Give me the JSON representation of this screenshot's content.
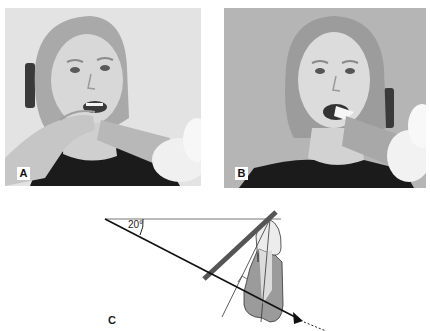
{
  "figure": {
    "panels": [
      {
        "id": "A",
        "label": "A",
        "description": "Patient holding receptor with finger, tube cone angled upward from lower right",
        "colors": {
          "background": "#e4e4e4",
          "shirt": "#1a1a1a",
          "skin": "#d6d6d6",
          "hair": "#a8a8a8"
        }
      },
      {
        "id": "B",
        "label": "B",
        "description": "Patient biting on receptor holder with tube cone from lower right",
        "colors": {
          "background": "#b4b4b4",
          "shirt": "#1a1a1a",
          "skin": "#dcdcdc",
          "hair": "#9a9a9a"
        }
      }
    ],
    "diagram": {
      "label": "C",
      "angle_label": "20°",
      "angle_degrees": 20,
      "elements": [
        "horizontal-reference-line",
        "central-ray-line",
        "receptor-plate",
        "tooth-crown",
        "tooth-root",
        "bisector-line",
        "long-axis-line",
        "ray-arrowhead",
        "dashed-ray-extension"
      ],
      "colors": {
        "plate": "#555555",
        "root": "#9a9a9a",
        "crown": "#e6e6e6",
        "line": "#111111"
      }
    }
  }
}
